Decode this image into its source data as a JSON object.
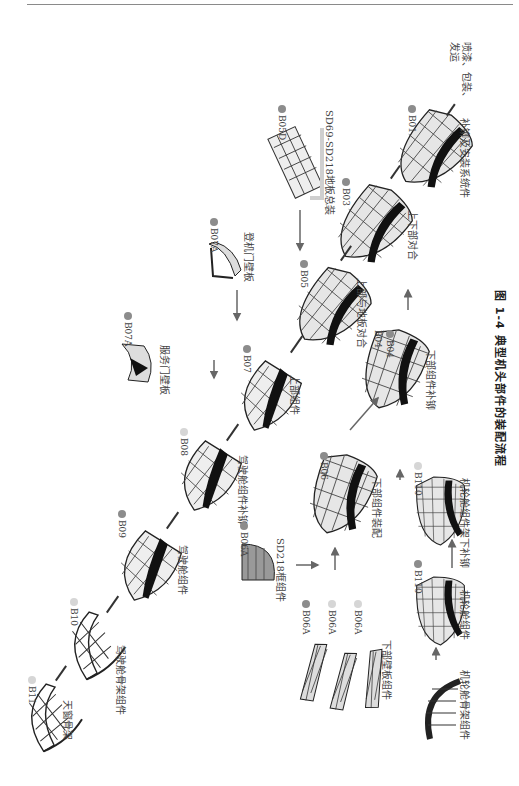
{
  "page": {
    "figure_caption": "图 1-4   典型机头部件的装配流程"
  },
  "nodes": [
    {
      "id": "B11",
      "code": "B11",
      "label": "天窗骨架",
      "dot": "light"
    },
    {
      "id": "B10",
      "code": "B10",
      "label": "驾驶舱骨架组件",
      "dot": "light"
    },
    {
      "id": "B09",
      "code": "B09",
      "label": "驾驶舱组件",
      "dot": "dark"
    },
    {
      "id": "B08",
      "code": "B08",
      "label": "驾驶舱组件补铆",
      "dot": "light"
    },
    {
      "id": "B07",
      "code": "B07",
      "label": "上部组件",
      "dot": "dark"
    },
    {
      "id": "B07A_service",
      "code": "B07A",
      "label": "服务门壁板",
      "dot": "dark"
    },
    {
      "id": "B07A_boarding",
      "code": "B07A",
      "label": "登机门壁板",
      "dot": "dark"
    },
    {
      "id": "B05",
      "code": "B05",
      "label": "上部与地板对合",
      "dot": "dark"
    },
    {
      "id": "B05D",
      "code": "B05D",
      "label": "SD69-SD218地板总装",
      "dot": "dark"
    },
    {
      "id": "B03",
      "code": "B03",
      "label": "上下部对合",
      "dot": "dark"
    },
    {
      "id": "B01",
      "code": "B01",
      "label": "补铆及安装系统件",
      "dot": "dark"
    },
    {
      "id": "final",
      "code": "",
      "label": "喷漆、包装、发运",
      "dot": "none"
    },
    {
      "id": "B06A_frame",
      "code": "B06A",
      "label": "SD218框组件",
      "dot": "dark"
    },
    {
      "id": "B06",
      "code": "B06",
      "label": "下部组件装配",
      "dot": "dark"
    },
    {
      "id": "B06A_panels",
      "codes": [
        "B06A",
        "B06A",
        "B06A"
      ],
      "label": "下部壁板组件",
      "dots": [
        "dark",
        "light",
        "light"
      ]
    },
    {
      "id": "B04",
      "codes": [
        "B04",
        "B04"
      ],
      "label": "下部组件补铆",
      "dots": [
        "light",
        "dark"
      ]
    },
    {
      "id": "B110_skeleton",
      "code": "",
      "label": "机轮舱骨架组件",
      "dot": "none"
    },
    {
      "id": "B110_a",
      "code": "B110",
      "label": "机轮舱组件",
      "dot": "dark"
    },
    {
      "id": "B110_b",
      "code": "B110",
      "label": "机轮舱组件架下补铆",
      "dot": "light"
    }
  ],
  "edges": [
    {
      "from": "B11",
      "to": "B10",
      "style": "line"
    },
    {
      "from": "B10",
      "to": "B09",
      "style": "line"
    },
    {
      "from": "B09",
      "to": "B08",
      "style": "line"
    },
    {
      "from": "B08",
      "to": "B07",
      "style": "line"
    },
    {
      "from": "B07A_service",
      "to": "B07",
      "style": "arrow"
    },
    {
      "from": "B07",
      "to": "B05",
      "style": "line"
    },
    {
      "from": "B07A_boarding",
      "to": "B07",
      "style": "arrow"
    },
    {
      "from": "B05D",
      "to": "B05",
      "style": "arrow"
    },
    {
      "from": "B05",
      "to": "B03",
      "style": "line"
    },
    {
      "from": "B03",
      "to": "B01",
      "style": "line"
    },
    {
      "from": "B01",
      "to": "final",
      "style": "line"
    },
    {
      "from": "B06A_frame",
      "to": "B06",
      "style": "arrow"
    },
    {
      "from": "B06A_panels",
      "to": "B06",
      "style": "arrow"
    },
    {
      "from": "B110_skeleton",
      "to": "B110_a",
      "style": "arrow"
    },
    {
      "from": "B110_a",
      "to": "B110_b",
      "style": "arrow"
    },
    {
      "from": "B110_b",
      "to": "B06",
      "style": "arrow"
    },
    {
      "from": "B06",
      "to": "B04",
      "style": "arrow"
    },
    {
      "from": "B04",
      "to": "B03",
      "style": "arrow"
    }
  ],
  "colors": {
    "dot_dark": "#8c8c8c",
    "dot_light": "#d6d6d6",
    "line": "#333333",
    "arrow": "#666666",
    "rule": "#8a8a8a"
  }
}
